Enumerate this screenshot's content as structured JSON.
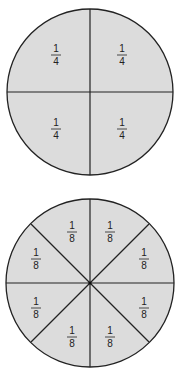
{
  "diagram": {
    "fill_color": "#dcdcdc",
    "stroke_color": "#222222",
    "circles": [
      {
        "name": "fourths",
        "parts": 4,
        "labels": [
          {
            "numerator": "1",
            "denominator": "4"
          },
          {
            "numerator": "1",
            "denominator": "4"
          },
          {
            "numerator": "1",
            "denominator": "4"
          },
          {
            "numerator": "1",
            "denominator": "4"
          }
        ]
      },
      {
        "name": "eighths",
        "parts": 8,
        "labels": [
          {
            "numerator": "1",
            "denominator": "8"
          },
          {
            "numerator": "1",
            "denominator": "8"
          },
          {
            "numerator": "1",
            "denominator": "8"
          },
          {
            "numerator": "1",
            "denominator": "8"
          },
          {
            "numerator": "1",
            "denominator": "8"
          },
          {
            "numerator": "1",
            "denominator": "8"
          },
          {
            "numerator": "1",
            "denominator": "8"
          },
          {
            "numerator": "1",
            "denominator": "8"
          }
        ]
      }
    ]
  }
}
